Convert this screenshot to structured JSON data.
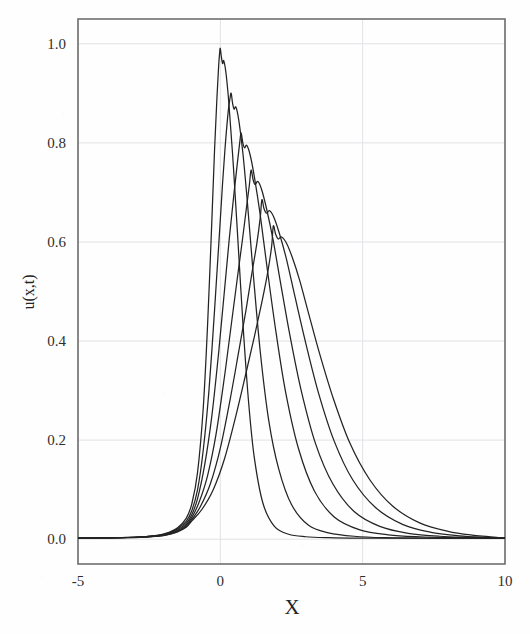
{
  "figure": {
    "background_color": "#fefefe",
    "frame_color": "#6f6f6f",
    "grid_color": "#e2e2e6",
    "curve_color": "#232323"
  },
  "chart_data": {
    "type": "line",
    "title": "",
    "subtitle": "",
    "xlabel": "X",
    "ylabel": "u(x,t)",
    "xlim": [
      -5,
      10
    ],
    "ylim": [
      -0.05,
      1.05
    ],
    "grid": true,
    "legend": "none",
    "xticks": [
      -5,
      0,
      5,
      10
    ],
    "xtick_labels": [
      "-5",
      "0",
      "5",
      "10"
    ],
    "yticks": [
      0.0,
      0.2,
      0.4,
      0.6,
      0.8,
      1.0
    ],
    "ytick_labels": [
      "0.0",
      "0.2",
      "0.4",
      "0.6",
      "0.8",
      "1.0"
    ],
    "annotations": [],
    "series": [
      {
        "name": "t1",
        "peak_x": 0.0,
        "peak_y": 0.99,
        "x": [
          -5.0,
          -3.0,
          -2.2,
          -1.8,
          -1.5,
          -1.2,
          -1.0,
          -0.8,
          -0.6,
          -0.45,
          -0.3,
          -0.2,
          -0.12,
          -0.06,
          -0.02,
          0.0,
          0.04,
          0.08,
          0.12,
          0.2,
          0.3,
          0.45,
          0.6,
          0.8,
          1.0,
          1.2,
          1.5,
          1.9,
          2.4,
          3.0,
          3.8,
          4.8,
          6.0,
          7.5,
          10.0
        ],
        "y": [
          0.002,
          0.004,
          0.008,
          0.014,
          0.023,
          0.042,
          0.072,
          0.135,
          0.265,
          0.43,
          0.64,
          0.79,
          0.89,
          0.955,
          0.985,
          0.99,
          0.972,
          0.96,
          0.966,
          0.94,
          0.88,
          0.76,
          0.62,
          0.43,
          0.272,
          0.162,
          0.072,
          0.026,
          0.01,
          0.005,
          0.003,
          0.002,
          0.002,
          0.002,
          0.002
        ]
      },
      {
        "name": "t2",
        "peak_x": 0.38,
        "peak_y": 0.9,
        "x": [
          -5.0,
          -3.0,
          -2.2,
          -1.8,
          -1.5,
          -1.2,
          -1.0,
          -0.8,
          -0.6,
          -0.4,
          -0.2,
          -0.05,
          0.08,
          0.18,
          0.28,
          0.34,
          0.38,
          0.43,
          0.48,
          0.55,
          0.65,
          0.8,
          0.95,
          1.15,
          1.4,
          1.7,
          2.05,
          2.5,
          3.1,
          3.8,
          4.7,
          5.8,
          7.0,
          8.5,
          10.0
        ],
        "y": [
          0.002,
          0.004,
          0.008,
          0.013,
          0.021,
          0.036,
          0.058,
          0.1,
          0.18,
          0.3,
          0.465,
          0.6,
          0.72,
          0.8,
          0.865,
          0.89,
          0.9,
          0.88,
          0.868,
          0.872,
          0.845,
          0.775,
          0.68,
          0.54,
          0.38,
          0.24,
          0.142,
          0.07,
          0.028,
          0.013,
          0.006,
          0.003,
          0.002,
          0.002,
          0.002
        ]
      },
      {
        "name": "t3",
        "peak_x": 0.73,
        "peak_y": 0.82,
        "x": [
          -5.0,
          -3.0,
          -2.2,
          -1.8,
          -1.5,
          -1.2,
          -1.0,
          -0.8,
          -0.55,
          -0.3,
          -0.05,
          0.15,
          0.32,
          0.48,
          0.6,
          0.68,
          0.73,
          0.79,
          0.85,
          0.93,
          1.05,
          1.2,
          1.4,
          1.65,
          1.95,
          2.3,
          2.75,
          3.3,
          4.0,
          4.9,
          5.9,
          7.0,
          8.3,
          9.2,
          10.0
        ],
        "y": [
          0.002,
          0.004,
          0.007,
          0.012,
          0.019,
          0.032,
          0.05,
          0.082,
          0.15,
          0.248,
          0.382,
          0.505,
          0.61,
          0.698,
          0.76,
          0.8,
          0.82,
          0.8,
          0.79,
          0.795,
          0.775,
          0.73,
          0.655,
          0.545,
          0.42,
          0.295,
          0.182,
          0.098,
          0.045,
          0.019,
          0.009,
          0.005,
          0.003,
          0.002,
          0.002
        ]
      },
      {
        "name": "t4",
        "peak_x": 1.08,
        "peak_y": 0.745,
        "x": [
          -5.0,
          -3.0,
          -2.2,
          -1.8,
          -1.5,
          -1.2,
          -1.0,
          -0.75,
          -0.45,
          -0.15,
          0.15,
          0.4,
          0.6,
          0.78,
          0.92,
          1.02,
          1.08,
          1.15,
          1.22,
          1.32,
          1.45,
          1.62,
          1.85,
          2.12,
          2.45,
          2.85,
          3.35,
          3.95,
          4.7,
          5.6,
          6.6,
          7.7,
          8.8,
          9.5,
          10.0
        ],
        "y": [
          0.002,
          0.004,
          0.007,
          0.011,
          0.017,
          0.029,
          0.044,
          0.074,
          0.128,
          0.212,
          0.33,
          0.44,
          0.528,
          0.606,
          0.67,
          0.715,
          0.745,
          0.726,
          0.716,
          0.722,
          0.706,
          0.668,
          0.605,
          0.516,
          0.41,
          0.298,
          0.192,
          0.112,
          0.056,
          0.026,
          0.012,
          0.006,
          0.004,
          0.003,
          0.002
        ]
      },
      {
        "name": "t5",
        "peak_x": 1.46,
        "peak_y": 0.685,
        "x": [
          -5.0,
          -3.0,
          -2.2,
          -1.8,
          -1.5,
          -1.2,
          -1.0,
          -0.7,
          -0.35,
          0.0,
          0.35,
          0.65,
          0.9,
          1.1,
          1.28,
          1.4,
          1.46,
          1.53,
          1.62,
          1.73,
          1.88,
          2.07,
          2.32,
          2.62,
          3.0,
          3.45,
          4.0,
          4.65,
          5.45,
          6.4,
          7.4,
          8.4,
          9.2,
          9.7,
          10.0
        ],
        "y": [
          0.002,
          0.004,
          0.006,
          0.01,
          0.016,
          0.026,
          0.04,
          0.066,
          0.112,
          0.184,
          0.284,
          0.38,
          0.462,
          0.534,
          0.596,
          0.648,
          0.685,
          0.668,
          0.658,
          0.663,
          0.65,
          0.618,
          0.566,
          0.49,
          0.396,
          0.295,
          0.198,
          0.12,
          0.064,
          0.03,
          0.014,
          0.007,
          0.004,
          0.003,
          0.002
        ]
      },
      {
        "name": "t6",
        "peak_x": 1.86,
        "peak_y": 0.632,
        "x": [
          -5.0,
          -3.0,
          -2.2,
          -1.8,
          -1.5,
          -1.2,
          -1.0,
          -0.65,
          -0.25,
          0.15,
          0.55,
          0.9,
          1.2,
          1.45,
          1.65,
          1.8,
          1.86,
          1.94,
          2.03,
          2.15,
          2.32,
          2.52,
          2.78,
          3.1,
          3.5,
          3.98,
          4.55,
          5.25,
          6.05,
          7.0,
          8.0,
          8.9,
          9.5,
          9.8,
          10.0
        ],
        "y": [
          0.002,
          0.003,
          0.006,
          0.01,
          0.015,
          0.024,
          0.037,
          0.06,
          0.1,
          0.163,
          0.25,
          0.335,
          0.41,
          0.476,
          0.534,
          0.59,
          0.632,
          0.616,
          0.606,
          0.61,
          0.598,
          0.57,
          0.524,
          0.456,
          0.372,
          0.282,
          0.194,
          0.12,
          0.067,
          0.033,
          0.016,
          0.008,
          0.005,
          0.003,
          0.002
        ]
      }
    ]
  },
  "axes": {
    "x_title": "X",
    "y_title": "u(x,t)"
  }
}
